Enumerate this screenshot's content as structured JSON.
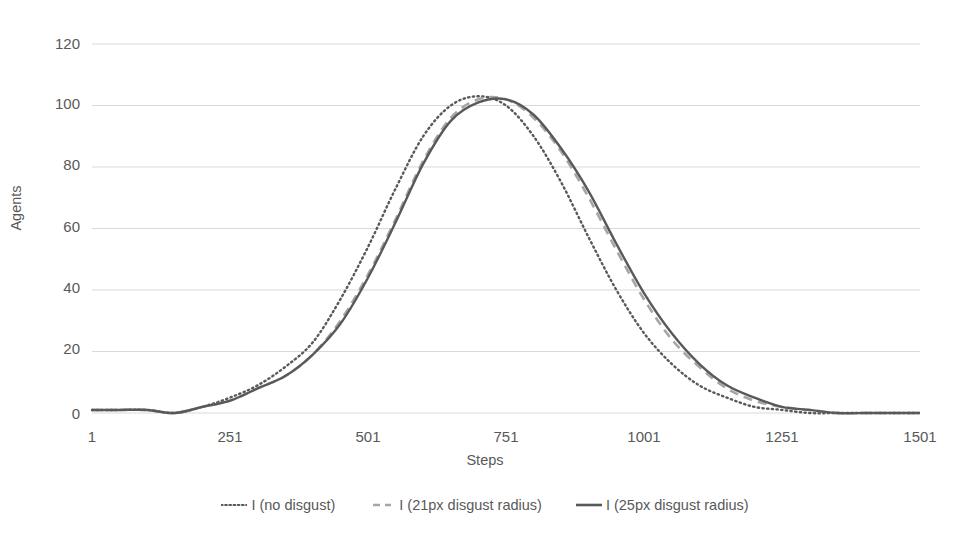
{
  "chart_data": {
    "type": "line",
    "title": "",
    "xlabel": "Steps",
    "ylabel": "Agents",
    "xlim": [
      1,
      1501
    ],
    "ylim": [
      0,
      120
    ],
    "grid": true,
    "legend_position": "bottom",
    "xticks": [
      "1",
      "251",
      "501",
      "751",
      "1001",
      "1251",
      "1501"
    ],
    "yticks": [
      "0",
      "20",
      "40",
      "60",
      "80",
      "100",
      "120"
    ],
    "x": [
      1,
      51,
      101,
      151,
      201,
      251,
      301,
      351,
      401,
      451,
      501,
      551,
      601,
      651,
      701,
      751,
      801,
      851,
      901,
      951,
      1001,
      1051,
      1101,
      1151,
      1201,
      1251,
      1301,
      1351,
      1401,
      1451,
      1501
    ],
    "series": [
      {
        "name": "I (no disgust)",
        "style": "dotted",
        "color": "#595959",
        "values": [
          1,
          1,
          1,
          0,
          2,
          5,
          9,
          15,
          23,
          37,
          54,
          73,
          90,
          100,
          103,
          100,
          90,
          75,
          57,
          40,
          26,
          16,
          9,
          5,
          2,
          1,
          0,
          0,
          0,
          0,
          0
        ]
      },
      {
        "name": "I (21px disgust radius)",
        "style": "dashed",
        "color": "#a6a6a6",
        "values": [
          1,
          1,
          1,
          0,
          2,
          4,
          8,
          12,
          19,
          30,
          45,
          63,
          82,
          96,
          102,
          102,
          96,
          85,
          70,
          53,
          37,
          24,
          15,
          8,
          4,
          2,
          1,
          0,
          0,
          0,
          0
        ]
      },
      {
        "name": "I (25px disgust radius)",
        "style": "solid",
        "color": "#595959",
        "values": [
          1,
          1,
          1,
          0,
          2,
          4,
          8,
          12,
          19,
          29,
          44,
          62,
          81,
          95,
          101,
          102,
          97,
          86,
          72,
          55,
          39,
          26,
          16,
          9,
          5,
          2,
          1,
          0,
          0,
          0,
          0
        ]
      }
    ],
    "colors": {
      "gridline": "#d9d9d9",
      "text": "#595959",
      "background": "#ffffff",
      "series_dark": "#595959",
      "series_light": "#a6a6a6"
    }
  }
}
